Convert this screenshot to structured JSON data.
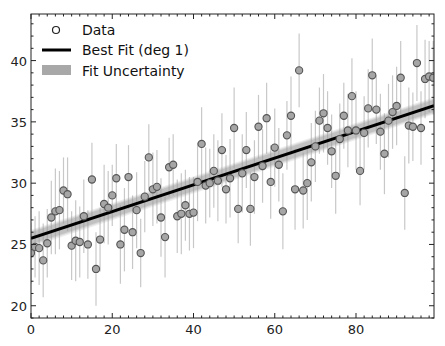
{
  "chart_data": {
    "type": "scatter",
    "title": "",
    "xlabel": "",
    "ylabel": "",
    "xlim": [
      0,
      99.2
    ],
    "ylim": [
      19.0,
      43.8
    ],
    "grid": false,
    "legend_position": "upper left",
    "x_ticks": [
      0,
      20,
      40,
      60,
      80
    ],
    "y_ticks": [
      20,
      25,
      30,
      35,
      40
    ],
    "legend": [
      {
        "label": "Data",
        "marker": "circle-open"
      },
      {
        "label": "Best Fit (deg 1)",
        "marker": "line"
      },
      {
        "label": "Fit Uncertainty",
        "marker": "band"
      }
    ],
    "fit": {
      "intercept": 25.5,
      "slope": 0.109,
      "band_halfwidth": 0.35
    },
    "series": [
      {
        "name": "Data",
        "x": [
          0,
          1,
          2,
          3,
          4,
          5,
          6,
          7,
          8,
          9,
          10,
          11,
          12,
          13,
          14,
          15,
          16,
          17,
          18,
          19,
          20,
          21,
          22,
          23,
          24,
          25,
          26,
          27,
          28,
          29,
          30,
          31,
          32,
          33,
          34,
          35,
          36,
          37,
          38,
          39,
          40,
          41,
          42,
          43,
          44,
          45,
          46,
          47,
          48,
          49,
          50,
          51,
          52,
          53,
          54,
          55,
          56,
          57,
          58,
          59,
          60,
          61,
          62,
          63,
          64,
          65,
          66,
          67,
          68,
          69,
          70,
          71,
          72,
          73,
          74,
          75,
          76,
          77,
          78,
          79,
          80,
          81,
          82,
          83,
          84,
          85,
          86,
          87,
          88,
          89,
          90,
          91,
          92,
          93,
          94,
          95,
          96,
          97,
          98,
          99
        ],
        "y": [
          24.3,
          24.8,
          24.7,
          23.7,
          25.1,
          27.2,
          27.7,
          27.8,
          29.4,
          29.1,
          24.9,
          25.3,
          25.2,
          27.3,
          25.0,
          30.3,
          23.0,
          25.4,
          28.3,
          28.0,
          29.0,
          30.4,
          25.0,
          26.2,
          30.5,
          26.0,
          27.8,
          24.3,
          28.9,
          32.1,
          29.5,
          29.7,
          27.2,
          25.6,
          31.3,
          31.5,
          27.3,
          27.5,
          28.2,
          27.5,
          27.6,
          30.1,
          33.2,
          29.8,
          30.0,
          31.0,
          30.2,
          32.7,
          29.5,
          30.4,
          34.5,
          27.9,
          30.8,
          32.7,
          27.9,
          30.5,
          34.6,
          31.4,
          35.3,
          30.1,
          32.9,
          31.5,
          27.7,
          33.9,
          35.5,
          29.5,
          39.2,
          29.4,
          30.0,
          31.7,
          33.0,
          35.1,
          35.7,
          34.5,
          32.6,
          30.6,
          33.6,
          35.5,
          34.3,
          37.1,
          34.3,
          31.0,
          34.1,
          36.1,
          38.8,
          36.0,
          34.2,
          32.4,
          35.1,
          35.8,
          36.3,
          38.6,
          29.2,
          34.7,
          34.6,
          39.8,
          34.5,
          38.5,
          38.7,
          38.6
        ],
        "yerr": [
          2.5,
          2.5,
          3.0,
          3.0,
          2.8,
          3.0,
          3.5,
          3.2,
          2.7,
          3.0,
          2.8,
          3.3,
          2.9,
          3.0,
          2.8,
          3.0,
          3.0,
          2.6,
          3.2,
          3.0,
          2.5,
          2.8,
          3.2,
          3.4,
          2.6,
          3.0,
          3.1,
          2.8,
          2.9,
          2.7,
          3.0,
          3.0,
          3.2,
          3.3,
          2.4,
          2.5,
          3.0,
          3.3,
          2.9,
          3.0,
          2.9,
          3.2,
          3.0,
          3.1,
          2.8,
          3.0,
          3.3,
          3.0,
          2.8,
          3.2,
          3.3,
          2.8,
          3.2,
          3.1,
          3.0,
          3.0,
          2.6,
          3.0,
          2.9,
          3.0,
          3.2,
          3.0,
          3.1,
          2.8,
          3.2,
          3.3,
          3.0,
          3.1,
          3.0,
          3.2,
          2.9,
          2.7,
          3.2,
          3.0,
          3.0,
          3.1,
          2.9,
          2.7,
          3.0,
          3.1,
          3.2,
          2.8,
          3.0,
          3.2,
          3.0,
          2.8,
          3.1,
          3.3,
          3.0,
          3.0,
          3.2,
          3.0,
          3.0,
          3.1,
          2.8,
          3.1,
          3.0,
          3.2,
          2.9,
          3.0
        ]
      }
    ]
  },
  "caption_text": ""
}
